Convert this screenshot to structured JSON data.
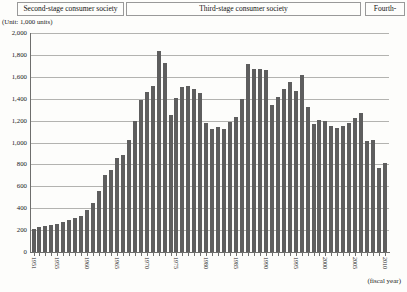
{
  "header": {
    "stages": [
      {
        "label": "Second-stage consumer society"
      },
      {
        "label": "Third-stage consumer society"
      },
      {
        "label": "Fourth-"
      }
    ]
  },
  "chart_data": {
    "type": "bar",
    "title": "",
    "unit_label": "(Unit: 1,000 units)",
    "xlabel": "(fiscal year)",
    "ylabel": "",
    "ylim": [
      0,
      2000
    ],
    "ytick_interval": 200,
    "grid": true,
    "bar_color": "#5e5e5e",
    "y_tick_labels": [
      "0",
      "200",
      "400",
      "600",
      "800",
      "1,000",
      "1,200",
      "1,400",
      "1,600",
      "1,800",
      "2,000"
    ],
    "x_tick_labels": [
      "1951",
      "1955",
      "1960",
      "1965",
      "1970",
      "1975",
      "1980",
      "1985",
      "1990",
      "1995",
      "2000",
      "2005",
      "2010"
    ],
    "x": [
      1951,
      1952,
      1953,
      1954,
      1955,
      1956,
      1957,
      1958,
      1959,
      1960,
      1961,
      1962,
      1963,
      1964,
      1965,
      1966,
      1967,
      1968,
      1969,
      1970,
      1971,
      1972,
      1973,
      1974,
      1975,
      1976,
      1977,
      1978,
      1979,
      1980,
      1981,
      1982,
      1983,
      1984,
      1985,
      1986,
      1987,
      1988,
      1989,
      1990,
      1991,
      1992,
      1993,
      1994,
      1995,
      1996,
      1997,
      1998,
      1999,
      2000,
      2001,
      2002,
      2003,
      2004,
      2005,
      2006,
      2007,
      2008,
      2009,
      2010
    ],
    "values": [
      210,
      230,
      240,
      245,
      255,
      275,
      295,
      310,
      330,
      385,
      450,
      560,
      700,
      750,
      860,
      890,
      1020,
      1200,
      1390,
      1460,
      1515,
      1840,
      1730,
      1250,
      1410,
      1510,
      1520,
      1490,
      1455,
      1180,
      1125,
      1140,
      1120,
      1190,
      1230,
      1400,
      1720,
      1670,
      1675,
      1660,
      1340,
      1420,
      1490,
      1550,
      1470,
      1620,
      1320,
      1165,
      1210,
      1200,
      1150,
      1130,
      1150,
      1180,
      1220,
      1270,
      1015,
      1020,
      770,
      810
    ]
  }
}
